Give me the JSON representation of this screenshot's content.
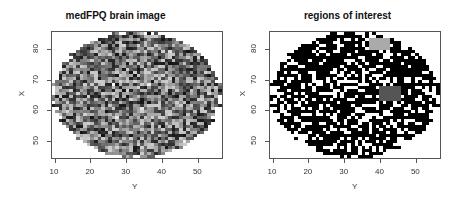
{
  "chart_data": [
    {
      "type": "heatmap",
      "title": "medFPQ brain image",
      "xlabel": "Y",
      "ylabel": "X",
      "xlim": [
        9,
        57
      ],
      "ylim": [
        44,
        86
      ],
      "xticks": [
        10,
        20,
        30,
        40,
        50
      ],
      "yticks": [
        50,
        60,
        70,
        80
      ],
      "colormap": "grayscale",
      "mask": "ellipse centered near (Y=33, X=65), width ~47, height ~42",
      "description": "Grayscale voxel intensity image of a brain slice; irregular mosaic of gray levels from black to white"
    },
    {
      "type": "heatmap",
      "title": "regions of interest",
      "xlabel": "Y",
      "ylabel": "X",
      "xlim": [
        9,
        57
      ],
      "ylim": [
        44,
        86
      ],
      "xticks": [
        10,
        20,
        30,
        40,
        50
      ],
      "yticks": [
        50,
        60,
        70,
        80
      ],
      "colormap": "binary (black = active, white = inactive)",
      "highlighted_regions": [
        {
          "name": "light gray region",
          "color": "#aaaaaa",
          "y_range": [
            37,
            43
          ],
          "x_range": [
            80,
            84
          ]
        },
        {
          "name": "dark gray region",
          "color": "#555555",
          "y_range": [
            40,
            46
          ],
          "x_range": [
            63,
            68
          ]
        }
      ],
      "description": "Binary mask of significant voxels with two small highlighted gray regions"
    }
  ],
  "panels": [
    {
      "title": "medFPQ brain image",
      "xlabel": "Y",
      "ylabel": "X"
    },
    {
      "title": "regions of interest",
      "xlabel": "Y",
      "ylabel": "X"
    }
  ],
  "axes": {
    "xticks": [
      "10",
      "20",
      "30",
      "40",
      "50"
    ],
    "yticks": [
      "50",
      "60",
      "70",
      "80"
    ]
  }
}
